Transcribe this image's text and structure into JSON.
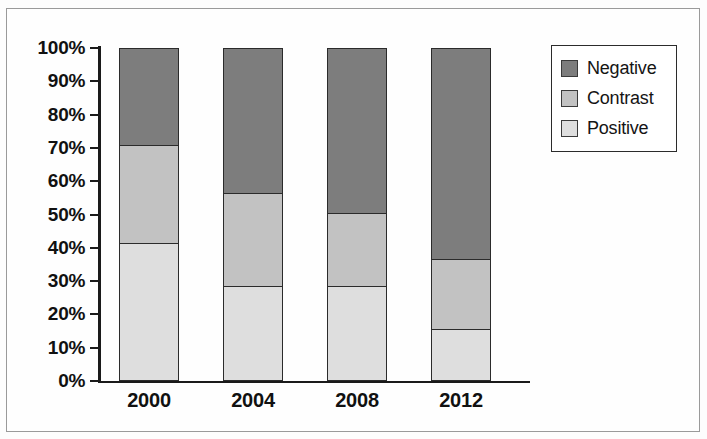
{
  "chart_data": {
    "type": "bar",
    "subtype": "stacked-bar-100",
    "title": "",
    "xlabel": "",
    "ylabel": "",
    "categories": [
      "2000",
      "2004",
      "2008",
      "2012"
    ],
    "series": [
      {
        "name": "Negative",
        "color": "#7d7d7d",
        "values": [
          29.0,
          43.5,
          49.5,
          63.5
        ]
      },
      {
        "name": "Contrast",
        "color": "#c2c2c2",
        "values": [
          30.0,
          28.5,
          22.5,
          21.5
        ]
      },
      {
        "name": "Positive",
        "color": "#dedede",
        "values": [
          41.0,
          28.0,
          28.0,
          15.0
        ]
      }
    ],
    "stack_order_bottom_to_top": [
      "Positive",
      "Contrast",
      "Negative"
    ],
    "cumulative_boundaries_percent": {
      "2000": {
        "positive_top": 41.0,
        "contrast_top": 71.0,
        "negative_top": 100.0
      },
      "2004": {
        "positive_top": 28.0,
        "contrast_top": 56.5,
        "negative_top": 100.0
      },
      "2008": {
        "positive_top": 28.0,
        "contrast_top": 50.5,
        "negative_top": 100.0
      },
      "2012": {
        "positive_top": 15.0,
        "contrast_top": 36.5,
        "negative_top": 100.0
      }
    },
    "ylim": [
      0,
      100
    ],
    "ytick_labels": [
      "100%",
      "90%",
      "80%",
      "70%",
      "60%",
      "50%",
      "40%",
      "30%",
      "20%",
      "10%",
      "0%"
    ],
    "ytick_values": [
      100,
      90,
      80,
      70,
      60,
      50,
      40,
      30,
      20,
      10,
      0
    ],
    "grid": false,
    "legend_position": "right-top",
    "legend_entries": [
      "Negative",
      "Contrast",
      "Positive"
    ]
  },
  "legend": {
    "items": [
      {
        "label": "Negative",
        "color": "#7d7d7d"
      },
      {
        "label": "Contrast",
        "color": "#c2c2c2"
      },
      {
        "label": "Positive",
        "color": "#dedede"
      }
    ]
  },
  "axes": {
    "y_ticks": [
      {
        "label": "100%",
        "value": 100
      },
      {
        "label": "90%",
        "value": 90
      },
      {
        "label": "80%",
        "value": 80
      },
      {
        "label": "70%",
        "value": 70
      },
      {
        "label": "60%",
        "value": 60
      },
      {
        "label": "50%",
        "value": 50
      },
      {
        "label": "40%",
        "value": 40
      },
      {
        "label": "30%",
        "value": 30
      },
      {
        "label": "20%",
        "value": 20
      },
      {
        "label": "10%",
        "value": 10
      },
      {
        "label": "0%",
        "value": 0
      }
    ],
    "x_labels": [
      "2000",
      "2004",
      "2008",
      "2012"
    ]
  }
}
